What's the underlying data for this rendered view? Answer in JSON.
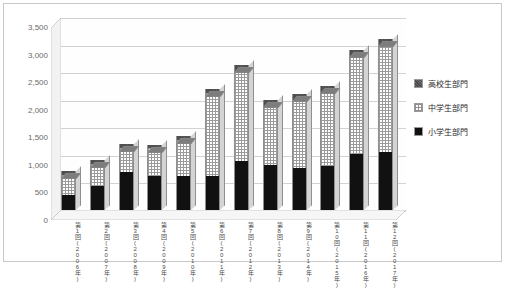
{
  "chart_data": {
    "type": "bar",
    "subtype": "stacked-column-3d",
    "title": "",
    "xlabel": "",
    "ylabel": "",
    "ylim": [
      0,
      3500
    ],
    "ytick_step": 500,
    "grid": true,
    "legend_position": "right",
    "ytick_labels": [
      "3,500",
      "3,000",
      "2,500",
      "2,000",
      "1,500",
      "1,000",
      "500",
      "0"
    ],
    "ytick_values": [
      3500,
      3000,
      2500,
      2000,
      1500,
      1000,
      500,
      0
    ],
    "categories": [
      "第1回\n(2006年)",
      "第2回\n(2007年)",
      "第3回\n(2008年)",
      "第4回\n(2009年)",
      "第5回\n(2010年)",
      "第6回\n(2011年)",
      "第7回\n(2012年)",
      "第8回\n(2013年)",
      "第9回\n(2014年)",
      "第10回\n(2015年)",
      "第11回\n(2016年)",
      "第12回\n(2017年)"
    ],
    "series": [
      {
        "name": "小学生部門",
        "color": "#111111",
        "values": [
          270,
          440,
          690,
          620,
          610,
          610,
          880,
          810,
          770,
          790,
          1010,
          1060
        ]
      },
      {
        "name": "中学生部門",
        "color": "#ffffff",
        "values": [
          370,
          400,
          440,
          500,
          660,
          1520,
          1640,
          1080,
          1230,
          1340,
          1760,
          1900
        ]
      },
      {
        "name": "高校生部門",
        "color": "#6b6b6b",
        "values": [
          60,
          60,
          70,
          60,
          80,
          70,
          110,
          110,
          100,
          120,
          130,
          140
        ]
      }
    ],
    "totals": [
      700,
      900,
      1200,
      1180,
      1350,
      2200,
      2630,
      2000,
      2100,
      2250,
      2900,
      3100
    ]
  },
  "legend": {
    "items": [
      {
        "label": "高校生部門",
        "swatch": "hs"
      },
      {
        "label": "中学生部門",
        "swatch": "jh"
      },
      {
        "label": "小学生部門",
        "swatch": "es"
      }
    ]
  }
}
